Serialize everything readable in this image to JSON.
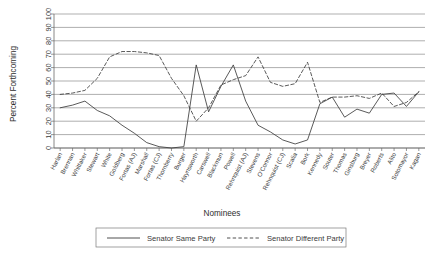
{
  "chart_data": {
    "type": "line",
    "title": "",
    "xlabel": "Nominees",
    "ylabel": "Percent Forthcoming",
    "ylim": [
      0,
      100
    ],
    "grid": true,
    "legend_position": "bottom",
    "yticks": [
      "0",
      "10",
      "20",
      "30",
      "40",
      "50",
      "60",
      "70",
      "80",
      "90",
      "100"
    ],
    "categories": [
      "Harlan",
      "Brennan",
      "Whittaker",
      "Stewart",
      "White",
      "Goldberg",
      "Fortas (AJ)",
      "Marshall",
      "Fortas (CJ)",
      "Thornberry",
      "Burger",
      "Haynsworth",
      "Carswell",
      "Blackmun",
      "Powell",
      "Rehnquist (AJ)",
      "Stevens",
      "O'Connor",
      "Rehnquist (CJ)",
      "Scalia",
      "Bork",
      "Kennedy",
      "Souter",
      "Thomas",
      "Ginsburg",
      "Breyer",
      "Roberts",
      "Alito",
      "Sotomayor",
      "Kagan"
    ],
    "series": [
      {
        "name": "Senator Same Party",
        "style": "solid",
        "values": [
          30,
          32,
          35,
          28,
          24,
          17,
          11,
          4,
          1,
          0,
          1,
          62,
          27,
          46,
          62,
          35,
          17,
          12,
          6,
          3,
          6,
          33,
          38,
          23,
          29,
          26,
          40,
          41,
          31,
          42
        ]
      },
      {
        "name": "Senator Different Party",
        "style": "dashed",
        "values": [
          40,
          41,
          43,
          52,
          68,
          72,
          72,
          71,
          69,
          52,
          39,
          20,
          30,
          47,
          51,
          54,
          68,
          49,
          46,
          48,
          64,
          34,
          38,
          38,
          39,
          37,
          41,
          31,
          34,
          42
        ]
      }
    ],
    "legend": [
      {
        "label": "Senator Same Party",
        "style": "solid"
      },
      {
        "label": "Senator Different Party",
        "style": "dashed"
      }
    ]
  }
}
